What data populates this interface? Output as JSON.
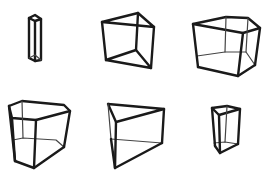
{
  "title": "Wireframe prisms",
  "style": {
    "stroke_color": "#1a1a1a",
    "back_edge_color": "#444444",
    "background": "#ffffff"
  },
  "figures": [
    {
      "id": "prism-1",
      "kind": "tall thin rectangular prism"
    },
    {
      "id": "prism-2",
      "kind": "triangular prism"
    },
    {
      "id": "prism-3",
      "kind": "pentagonal prism"
    },
    {
      "id": "prism-4",
      "kind": "pentagonal prism"
    },
    {
      "id": "prism-5",
      "kind": "triangular prism"
    },
    {
      "id": "prism-6",
      "kind": "small triangular prism"
    }
  ]
}
